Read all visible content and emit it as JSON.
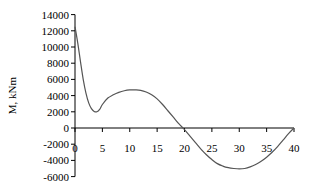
{
  "chart_data": {
    "type": "line",
    "title": "",
    "xlabel": "",
    "ylabel": "M, kNm",
    "xlim": [
      0,
      40
    ],
    "ylim": [
      -6000,
      14000
    ],
    "x_ticks": [
      0,
      5,
      10,
      15,
      20,
      25,
      30,
      35,
      40
    ],
    "y_ticks": [
      14000,
      12000,
      10000,
      8000,
      6000,
      4000,
      2000,
      0,
      -2000,
      -4000,
      -6000
    ],
    "grid": false,
    "legend": null,
    "series": [
      {
        "name": "M",
        "color": "#555555",
        "x": [
          0,
          0.5,
          1,
          1.5,
          2,
          2.5,
          3,
          3.5,
          4,
          4.5,
          5,
          6,
          7,
          8,
          9,
          10,
          11,
          12,
          13,
          14,
          15,
          16,
          17,
          18,
          19,
          20,
          21,
          22,
          23,
          24,
          25,
          26,
          27,
          28,
          29,
          30,
          31,
          32,
          33,
          34,
          35,
          36,
          37,
          38,
          39,
          40
        ],
        "values": [
          12500,
          10500,
          8200,
          6000,
          4300,
          3100,
          2400,
          2050,
          2000,
          2300,
          2900,
          3700,
          4100,
          4400,
          4600,
          4700,
          4700,
          4650,
          4450,
          4100,
          3600,
          2900,
          2100,
          1300,
          500,
          -200,
          -1000,
          -1800,
          -2600,
          -3300,
          -3900,
          -4400,
          -4700,
          -4900,
          -5000,
          -5050,
          -5000,
          -4800,
          -4500,
          -4100,
          -3600,
          -3000,
          -2300,
          -1500,
          -700,
          0
        ]
      }
    ]
  }
}
